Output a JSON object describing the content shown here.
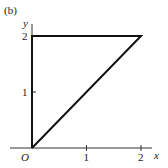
{
  "figure": {
    "panel_label": "(b)",
    "x_axis_label": "x",
    "y_axis_label": "y",
    "origin_label": "O",
    "x_ticks": [
      {
        "value": 1,
        "label": "1"
      },
      {
        "value": 2,
        "label": "2"
      }
    ],
    "y_ticks": [
      {
        "value": 1,
        "label": "1"
      },
      {
        "value": 2,
        "label": "2"
      }
    ],
    "region_vertices": [
      [
        0,
        0
      ],
      [
        0,
        2
      ],
      [
        2,
        2
      ]
    ],
    "region_description": "Triangle bounded by x = 0, y = 2, and y = x"
  }
}
